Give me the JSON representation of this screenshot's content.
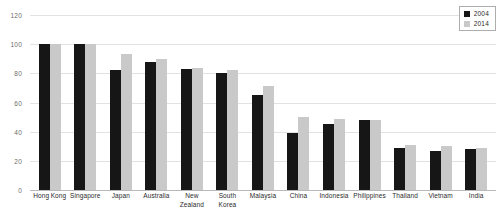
{
  "chart_data": {
    "type": "bar",
    "title": "",
    "subtitle": "",
    "xlabel": "",
    "ylabel": "",
    "ylim": [
      0,
      120
    ],
    "yticks": [
      0,
      20,
      40,
      60,
      80,
      100,
      120
    ],
    "grid": true,
    "legend_position": "top-right",
    "categories": [
      "Hong Kong",
      "Singapore",
      "Japan",
      "Australia",
      "New Zealand",
      "South Korea",
      "Malaysia",
      "China",
      "Indonesia",
      "Philippines",
      "Thailand",
      "Vietnam",
      "India"
    ],
    "series": [
      {
        "name": "2004",
        "color": "#161616",
        "values": [
          100,
          100,
          82,
          88,
          83,
          80,
          65,
          39,
          45,
          48,
          29,
          27,
          28
        ]
      },
      {
        "name": "2014",
        "color": "#c9c9c9",
        "values": [
          100,
          100,
          93,
          90,
          84,
          82,
          71,
          50,
          49,
          48,
          31,
          30,
          29
        ]
      }
    ]
  },
  "legend": {
    "items": [
      {
        "label": "2004",
        "series": 0
      },
      {
        "label": "2014",
        "series": 1
      }
    ]
  },
  "colors": {
    "series_2004": "#161616",
    "series_2014": "#c9c9c9",
    "gridline": "#e2e2e2",
    "axis_text": "#6d6d6d",
    "label_text": "#2b2b2b",
    "background": "#ffffff"
  }
}
